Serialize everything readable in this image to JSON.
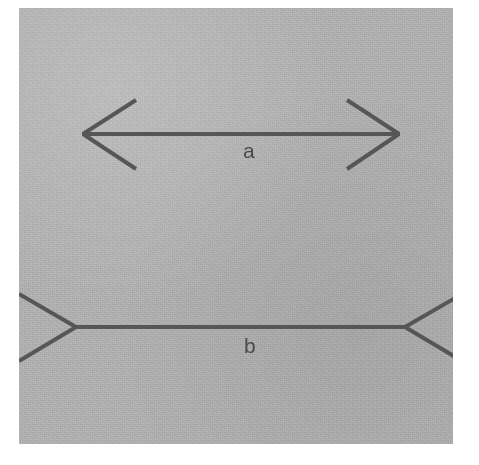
{
  "figure": {
    "name": "muller-lyer-illusion",
    "plate_background_color": "#b9b9b9",
    "line_color": "#565656",
    "page_background_color": "#ffffff",
    "labels": {
      "top_shaft": "a",
      "bottom_shaft": "b"
    },
    "caption_fragment": "",
    "top_figure": {
      "name": "arrowheads-outward-figure",
      "description": "horizontal shaft with outward-pointing arrowheads at both ends",
      "shaft": {
        "x1": 63,
        "y1": 126,
        "x2": 381,
        "y2": 126
      },
      "left_fins": [
        {
          "x1": 63,
          "y1": 126,
          "x2": 116,
          "y2": 92
        },
        {
          "x1": 63,
          "y1": 126,
          "x2": 116,
          "y2": 160
        }
      ],
      "right_fins": [
        {
          "x1": 381,
          "y1": 126,
          "x2": 329,
          "y2": 92
        },
        {
          "x1": 381,
          "y1": 126,
          "x2": 329,
          "y2": 160
        }
      ]
    },
    "bottom_figure": {
      "name": "arrowheads-inward-figure",
      "description": "horizontal shaft with inward-pointing (tail) fins at both ends",
      "shaft": {
        "x1": 57,
        "y1": 319,
        "x2": 386,
        "y2": 319
      },
      "left_fins": [
        {
          "x1": 57,
          "y1": 319,
          "x2": 2,
          "y2": 287
        },
        {
          "x1": 57,
          "y1": 319,
          "x2": 2,
          "y2": 352
        }
      ],
      "right_fins": [
        {
          "x1": 386,
          "y1": 319,
          "x2": 441,
          "y2": 287
        },
        {
          "x1": 386,
          "y1": 319,
          "x2": 441,
          "y2": 352
        }
      ]
    },
    "stroke_width": 4
  }
}
